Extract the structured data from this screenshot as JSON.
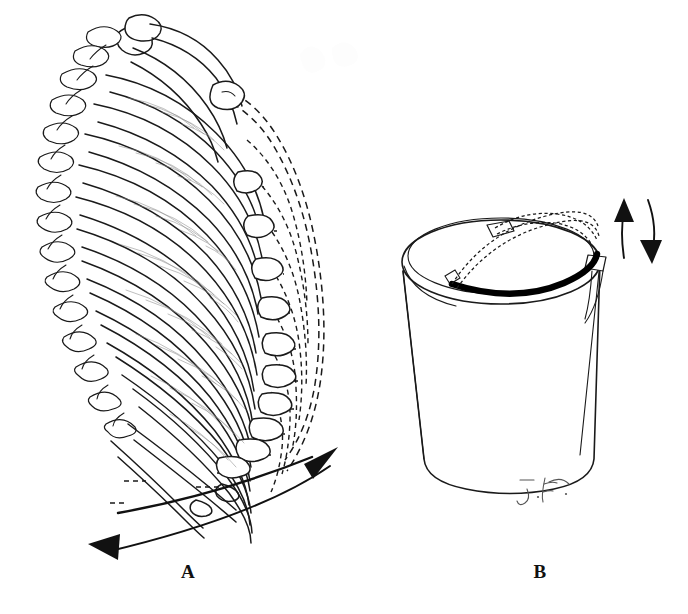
{
  "figure": {
    "kind": "anatomical-line-illustration",
    "title_visible": false,
    "background_color": "#ffffff",
    "ink_color": "#1a1a1a",
    "width_px": 688,
    "height_px": 614,
    "panels": [
      {
        "id": "A",
        "label": "A",
        "subject": "rib-cage-lateral-view",
        "label_position": {
          "x": 188,
          "y": 573
        },
        "elements": [
          "thoracic-vertebrae",
          "ribs-solid-resting-position",
          "intercostal-muscle-hatching",
          "costal-cartilage",
          "floating-ribs",
          "dashed-outline-elevated-inspiratory-position",
          "curved-double-arrow-elevation-depression"
        ]
      },
      {
        "id": "B",
        "label": "B",
        "subject": "bucket-with-swinging-handle",
        "label_position": {
          "x": 540,
          "y": 573
        },
        "elements": [
          "bucket-body",
          "bucket-rim",
          "handle-lowered-solid-black",
          "handle-raised-dashed",
          "handle-lug-left",
          "handle-lug-right",
          "up-arrow",
          "down-arrow",
          "artist-signature"
        ]
      }
    ],
    "signature": {
      "text": "J.F.",
      "style": "cursive-handwritten",
      "position": {
        "x": 548,
        "y": 492
      },
      "color": "#555555"
    },
    "arrows": {
      "panel_a": [
        {
          "name": "elevation-arrow",
          "direction": "up-right",
          "style": "curved-solid-filled-head"
        },
        {
          "name": "depression-arrow",
          "direction": "down-left",
          "style": "curved-solid-filled-head"
        }
      ],
      "panel_b": [
        {
          "name": "handle-raise-arrow",
          "direction": "up",
          "style": "slightly-curved-filled-head"
        },
        {
          "name": "handle-lower-arrow",
          "direction": "down",
          "style": "slightly-curved-filled-head"
        }
      ]
    },
    "line_styles": {
      "resting_position": "solid",
      "moved_position": "dashed",
      "handle_resting": "thick-solid-black",
      "handle_raised": "fine-dashed-chain"
    }
  }
}
